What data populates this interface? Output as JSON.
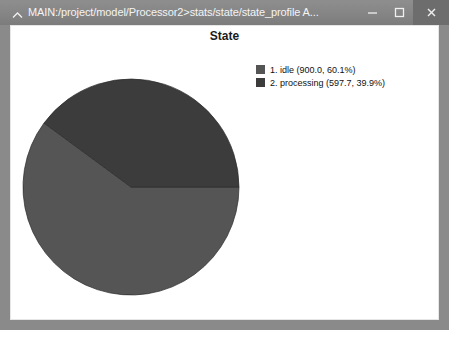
{
  "window": {
    "title": "MAIN:/project/model/Processor2>stats/state/state_profile A...",
    "caret_icon": "chevron-up-icon",
    "controls": {
      "minimize": {
        "name": "minimize-icon",
        "label": "–"
      },
      "maximize": {
        "name": "maximize-icon",
        "label": "□"
      },
      "close": {
        "name": "close-icon",
        "label": "×"
      }
    },
    "colors": {
      "titlebar": "#858585",
      "titlebar_text": "#f4f4f4",
      "close_button_bg": "#6d6d6d",
      "frame": "#8a8a8a",
      "plot_background": "#ffffff"
    }
  },
  "chart_data": {
    "type": "pie",
    "title": "State",
    "xlabel": "",
    "ylabel": "",
    "legend_position": "right",
    "grid": false,
    "start_angle_deg": 0,
    "direction": "clockwise",
    "categories": [
      "idle",
      "processing"
    ],
    "values": [
      900.0,
      597.7
    ],
    "percents": [
      60.1,
      39.9
    ],
    "colors": [
      "#555555",
      "#3c3c3c"
    ],
    "slices": [
      {
        "index": 1,
        "name": "idle",
        "value": 900.0,
        "percent": 60.1,
        "color": "#555555",
        "legend_text": "1. idle (900.0, 60.1%)"
      },
      {
        "index": 2,
        "name": "processing",
        "value": 597.7,
        "percent": 39.9,
        "color": "#3c3c3c",
        "legend_text": "2. processing (597.7, 39.9%)"
      }
    ]
  }
}
